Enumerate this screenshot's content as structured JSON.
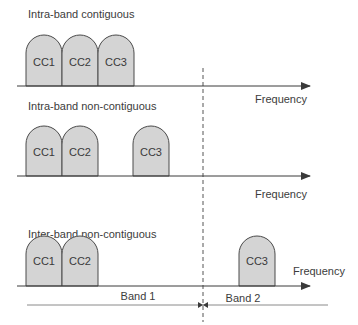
{
  "diagram": {
    "colors": {
      "cc_fill": "#d4d4d4",
      "cc_stroke": "#4a4a4a",
      "axis": "#3a3a3a",
      "text": "#3c3c3c"
    },
    "axis_label": "Frequency",
    "scenarios": [
      {
        "label": "Intra-band contiguous",
        "frequency_label": "Frequency",
        "carriers": [
          {
            "label": "CC1"
          },
          {
            "label": "CC2"
          },
          {
            "label": "CC3"
          }
        ]
      },
      {
        "label": "Intra-band non-contiguous",
        "frequency_label": "Frequency",
        "carriers": [
          {
            "label": "CC1"
          },
          {
            "label": "CC2"
          },
          {
            "label": "CC3"
          }
        ]
      },
      {
        "label": "Inter-band non-contiguous",
        "frequency_label": "Frequency",
        "carriers": [
          {
            "label": "CC1"
          },
          {
            "label": "CC2"
          },
          {
            "label": "CC3"
          }
        ]
      }
    ],
    "bands": [
      {
        "label": "Band 1"
      },
      {
        "label": "Band 2"
      }
    ]
  }
}
